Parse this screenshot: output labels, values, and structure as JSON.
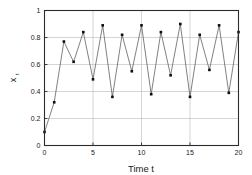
{
  "chart_data": {
    "type": "line",
    "title": "",
    "subtitle": "",
    "xlabel": "Time t",
    "ylabel": "x_t",
    "ylabel_main": "x",
    "ylabel_sub": "t",
    "xlim": [
      0,
      20
    ],
    "ylim": [
      0,
      1
    ],
    "grid": "horizontal",
    "legend": "none",
    "marker": "square",
    "marker_color": "#0d0d0d",
    "line_color": "#4a4a4a",
    "xticks": [
      0,
      5,
      10,
      15,
      20
    ],
    "xtick_labels": [
      "0",
      "5",
      "10",
      "15",
      "20"
    ],
    "yticks": [
      0,
      0.2,
      0.4,
      0.6,
      0.8,
      1
    ],
    "ytick_labels": [
      "0",
      "0.2",
      "0.4",
      "0.6",
      "0.8",
      "1"
    ],
    "x": [
      0,
      1,
      2,
      3,
      4,
      5,
      6,
      7,
      8,
      9,
      10,
      11,
      12,
      13,
      14,
      15,
      16,
      17,
      18,
      19,
      20
    ],
    "values": [
      0.1,
      0.32,
      0.77,
      0.62,
      0.84,
      0.49,
      0.89,
      0.36,
      0.82,
      0.55,
      0.89,
      0.38,
      0.84,
      0.52,
      0.9,
      0.36,
      0.82,
      0.56,
      0.89,
      0.39,
      0.84
    ],
    "series": [
      {
        "name": "x_t",
        "values": [
          0.1,
          0.32,
          0.77,
          0.62,
          0.84,
          0.49,
          0.89,
          0.36,
          0.82,
          0.55,
          0.89,
          0.38,
          0.84,
          0.52,
          0.9,
          0.36,
          0.82,
          0.56,
          0.89,
          0.39,
          0.84
        ]
      }
    ]
  }
}
